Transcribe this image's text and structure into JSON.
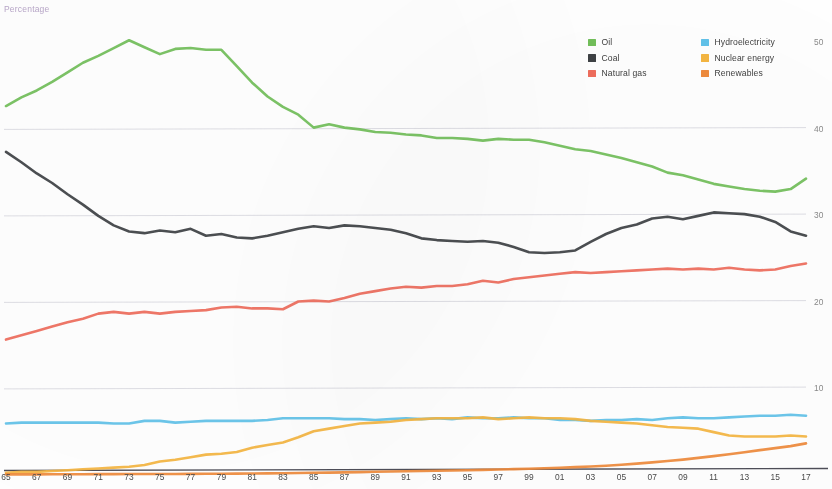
{
  "axis_title": "Percentage",
  "legend": {
    "columns": [
      {
        "items": [
          {
            "label": "Oil",
            "color": "#72c05a"
          },
          {
            "label": "Coal",
            "color": "#3e4245"
          },
          {
            "label": "Natural gas",
            "color": "#ef6d5d"
          }
        ]
      },
      {
        "items": [
          {
            "label": "Hydroelectricity",
            "color": "#61c3ea"
          },
          {
            "label": "Nuclear energy",
            "color": "#f5b642"
          },
          {
            "label": "Renewables",
            "color": "#ef8b3c"
          }
        ]
      }
    ]
  },
  "chart_data": {
    "type": "line",
    "title": "",
    "subtitle": "",
    "xlabel": "",
    "ylabel": "Percentage",
    "grid": true,
    "legend_position": "top-right",
    "ylim": [
      0,
      52
    ],
    "yticks": [
      10,
      20,
      30,
      40,
      50
    ],
    "ytick_labels": [
      "10",
      "20",
      "30",
      "40",
      "50"
    ],
    "xlim": [
      1965,
      2017
    ],
    "xticks": [
      1965,
      1967,
      1969,
      1971,
      1973,
      1975,
      1977,
      1979,
      1981,
      1983,
      1985,
      1987,
      1989,
      1991,
      1993,
      1995,
      1997,
      1999,
      2001,
      2003,
      2005,
      2007,
      2009,
      2011,
      2013,
      2015,
      2017
    ],
    "xtick_labels": [
      "65",
      "67",
      "69",
      "71",
      "73",
      "75",
      "77",
      "79",
      "81",
      "83",
      "85",
      "87",
      "89",
      "91",
      "93",
      "95",
      "97",
      "99",
      "01",
      "03",
      "05",
      "07",
      "09",
      "11",
      "13",
      "15",
      "17"
    ],
    "x": [
      1965,
      1966,
      1967,
      1968,
      1969,
      1970,
      1971,
      1972,
      1973,
      1974,
      1975,
      1976,
      1977,
      1978,
      1979,
      1980,
      1981,
      1982,
      1983,
      1984,
      1985,
      1986,
      1987,
      1988,
      1989,
      1990,
      1991,
      1992,
      1993,
      1994,
      1995,
      1996,
      1997,
      1998,
      1999,
      2000,
      2001,
      2002,
      2003,
      2004,
      2005,
      2006,
      2007,
      2008,
      2009,
      2010,
      2011,
      2012,
      2013,
      2014,
      2015,
      2016,
      2017
    ],
    "series": [
      {
        "name": "Oil",
        "color": "#72c05a",
        "values": [
          42.6,
          43.6,
          44.4,
          45.4,
          46.5,
          47.6,
          48.4,
          49.3,
          50.2,
          49.4,
          48.6,
          49.2,
          49.3,
          49.1,
          49.1,
          47.2,
          45.3,
          43.7,
          42.5,
          41.6,
          40.1,
          40.5,
          40.1,
          39.9,
          39.6,
          39.5,
          39.3,
          39.2,
          38.9,
          38.9,
          38.8,
          38.6,
          38.8,
          38.7,
          38.7,
          38.4,
          38.0,
          37.6,
          37.4,
          37.0,
          36.6,
          36.1,
          35.6,
          34.9,
          34.6,
          34.1,
          33.6,
          33.3,
          33.0,
          32.8,
          32.7,
          33.0,
          34.2
        ]
      },
      {
        "name": "Coal",
        "color": "#3e4245",
        "values": [
          37.3,
          36.1,
          34.8,
          33.7,
          32.4,
          31.2,
          29.9,
          28.8,
          28.1,
          27.9,
          28.2,
          28.0,
          28.4,
          27.6,
          27.8,
          27.4,
          27.3,
          27.6,
          28.0,
          28.4,
          28.7,
          28.5,
          28.8,
          28.7,
          28.5,
          28.3,
          27.9,
          27.3,
          27.1,
          27.0,
          26.9,
          27.0,
          26.8,
          26.3,
          25.7,
          25.6,
          25.7,
          25.9,
          26.9,
          27.8,
          28.5,
          28.9,
          29.6,
          29.8,
          29.5,
          29.9,
          30.3,
          30.2,
          30.1,
          29.8,
          29.2,
          28.1,
          27.6
        ]
      },
      {
        "name": "Natural gas",
        "color": "#ef6d5d",
        "values": [
          15.6,
          16.1,
          16.6,
          17.1,
          17.6,
          18.0,
          18.6,
          18.8,
          18.6,
          18.8,
          18.6,
          18.8,
          18.9,
          19.0,
          19.3,
          19.4,
          19.2,
          19.2,
          19.1,
          20.0,
          20.1,
          20.0,
          20.4,
          20.9,
          21.2,
          21.5,
          21.7,
          21.6,
          21.8,
          21.8,
          22.0,
          22.4,
          22.2,
          22.6,
          22.8,
          23.0,
          23.2,
          23.4,
          23.3,
          23.4,
          23.5,
          23.6,
          23.7,
          23.8,
          23.7,
          23.8,
          23.7,
          23.9,
          23.7,
          23.6,
          23.7,
          24.1,
          24.4
        ]
      },
      {
        "name": "Hydroelectricity",
        "color": "#61c3ea",
        "values": [
          5.9,
          6.0,
          6.0,
          6.0,
          6.0,
          6.0,
          6.0,
          5.9,
          5.9,
          6.2,
          6.2,
          6.0,
          6.1,
          6.2,
          6.2,
          6.2,
          6.2,
          6.3,
          6.5,
          6.5,
          6.5,
          6.5,
          6.4,
          6.4,
          6.3,
          6.4,
          6.5,
          6.4,
          6.5,
          6.4,
          6.6,
          6.5,
          6.5,
          6.6,
          6.5,
          6.5,
          6.3,
          6.3,
          6.2,
          6.3,
          6.3,
          6.4,
          6.3,
          6.5,
          6.6,
          6.5,
          6.5,
          6.6,
          6.7,
          6.8,
          6.8,
          6.9,
          6.8
        ]
      },
      {
        "name": "Nuclear energy",
        "color": "#f5b642",
        "values": [
          0.2,
          0.3,
          0.3,
          0.4,
          0.5,
          0.6,
          0.7,
          0.8,
          0.9,
          1.1,
          1.5,
          1.7,
          2.0,
          2.3,
          2.4,
          2.6,
          3.1,
          3.4,
          3.7,
          4.3,
          5.0,
          5.3,
          5.6,
          5.9,
          6.0,
          6.1,
          6.3,
          6.4,
          6.5,
          6.5,
          6.5,
          6.6,
          6.4,
          6.5,
          6.6,
          6.5,
          6.5,
          6.4,
          6.2,
          6.1,
          6.0,
          5.9,
          5.7,
          5.5,
          5.4,
          5.3,
          4.9,
          4.5,
          4.4,
          4.4,
          4.4,
          4.5,
          4.4
        ]
      },
      {
        "name": "Renewables",
        "color": "#ef8b3c",
        "values": [
          0.02,
          0.02,
          0.02,
          0.03,
          0.03,
          0.03,
          0.04,
          0.04,
          0.05,
          0.05,
          0.06,
          0.06,
          0.07,
          0.08,
          0.09,
          0.1,
          0.12,
          0.13,
          0.15,
          0.17,
          0.2,
          0.22,
          0.25,
          0.28,
          0.31,
          0.34,
          0.37,
          0.4,
          0.43,
          0.46,
          0.5,
          0.53,
          0.57,
          0.62,
          0.67,
          0.72,
          0.78,
          0.85,
          0.93,
          1.02,
          1.13,
          1.26,
          1.4,
          1.56,
          1.72,
          1.92,
          2.12,
          2.35,
          2.58,
          2.82,
          3.05,
          3.28,
          3.6
        ]
      }
    ]
  }
}
